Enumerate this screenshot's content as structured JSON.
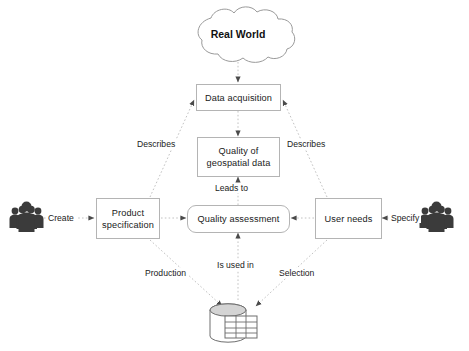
{
  "diagram": {
    "background_color": "#ffffff",
    "line_color": "#b4b4b4",
    "text_color": "#1a1a1a",
    "icon_color": "#3b3b3b"
  },
  "nodes": {
    "real_world": {
      "label": "Real World",
      "shape": "cloud"
    },
    "data_acquisition": {
      "label": "Data acquisition",
      "shape": "rectangle"
    },
    "quality_of_geospatial_data": {
      "label": "Quality of\ngeospatial data",
      "line1": "Quality of",
      "line2": "geospatial data",
      "shape": "rectangle"
    },
    "quality_assessment": {
      "label": "Quality assessment",
      "shape": "rounded-rectangle"
    },
    "product_specification": {
      "label": "Product\nspecification",
      "line1": "Product",
      "line2": "specification",
      "shape": "rectangle"
    },
    "user_needs": {
      "label": "User needs",
      "shape": "rectangle"
    },
    "database": {
      "label": "",
      "shape": "database-cylinder"
    },
    "producers": {
      "label": "",
      "shape": "people-group"
    },
    "users": {
      "label": "",
      "shape": "people-group"
    }
  },
  "edge_labels": {
    "create": "Create",
    "specify": "Specify",
    "describes_left": "Describes",
    "describes_right": "Describes",
    "leads_to": "Leads to",
    "production": "Production",
    "is_used_in": "Is used in",
    "selection": "Selection"
  },
  "icons": {
    "producers_group": "people-group-icon",
    "users_group": "people-group-icon",
    "database": "database-table-icon",
    "cloud": "cloud-icon"
  }
}
